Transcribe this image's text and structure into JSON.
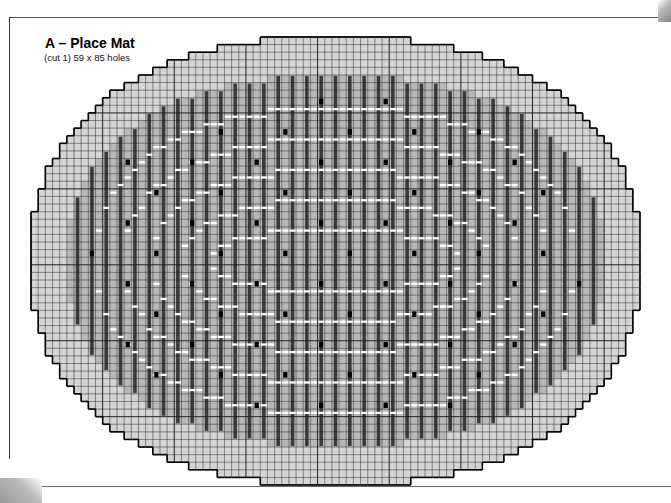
{
  "title": "A – Place Mat",
  "subtitle": "(cut 1) 59 x 85 holes",
  "grid": {
    "columns": 85,
    "rows": 59,
    "colors": {
      "border_fill": "#d4d4d4",
      "bar_fill": "#3a3a3a",
      "inner_fill": "#b8b8b8",
      "stitch_white": "#ffffff",
      "dot": "#000000",
      "grid_line": "#222222",
      "outline": "#000000"
    },
    "legend_elements": [
      "light-gray-border",
      "dark-vertical-bars",
      "white-horizontal-stitches",
      "black-french-knots"
    ]
  }
}
